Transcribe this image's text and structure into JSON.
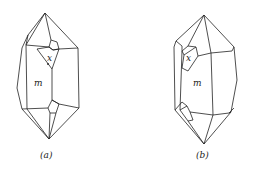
{
  "figure": {
    "crystals": [
      {
        "id": "a",
        "caption": "(a)",
        "face_labels": {
          "x": "x",
          "m": "m"
        }
      },
      {
        "id": "b",
        "caption": "(b)",
        "face_labels": {
          "x": "x",
          "m": "m"
        }
      }
    ],
    "colors": {
      "line": "#222222",
      "background": "#ffffff"
    }
  }
}
